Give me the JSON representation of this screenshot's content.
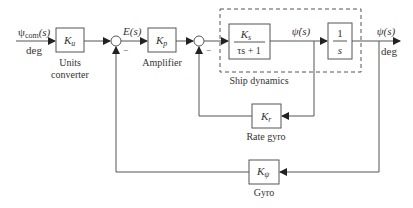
{
  "diagram": {
    "type": "block_diagram",
    "title": "",
    "input": {
      "signal": "ψ",
      "subscript": "com",
      "arg": "(s)",
      "unit": "deg"
    },
    "error_signal": {
      "label": "E(s)"
    },
    "output": {
      "signal": "ψ(s)",
      "unit": "deg"
    },
    "rate_signal": {
      "label": "ψ̇(s)"
    },
    "blocks": [
      {
        "id": "units",
        "gain": "K",
        "sub": "u",
        "caption_line1": "Units",
        "caption_line2": "converter"
      },
      {
        "id": "amp",
        "gain": "K",
        "sub": "p",
        "caption": "Amplifier"
      },
      {
        "id": "ship",
        "numerator": "K",
        "num_sub": "s",
        "denominator": "τs + 1"
      },
      {
        "id": "integrator",
        "numerator": "1",
        "denominator": "s"
      },
      {
        "id": "rate_gyro",
        "gain": "K",
        "sub": "r",
        "caption": "Rate gyro"
      },
      {
        "id": "gyro",
        "gain": "K",
        "sub": "ψ",
        "caption": "Gyro"
      }
    ],
    "group": {
      "caption": "Ship dynamics"
    },
    "summers": [
      {
        "id": "sum1",
        "sign_feedback": "−"
      },
      {
        "id": "sum2",
        "sign_feedback": "−"
      }
    ]
  }
}
